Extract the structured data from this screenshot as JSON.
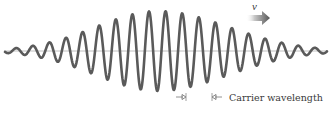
{
  "figure": {
    "colors": {
      "wave": "#5a5a5a",
      "axis": "#b0b0b0",
      "arrow_dark": "#555555",
      "arrow_light": "#d8d8d8",
      "text": "#3a3a3a",
      "background": "#ffffff"
    },
    "axis": {
      "y": 51,
      "x_start": 4,
      "x_end": 327
    },
    "wave": {
      "baseline_y": 51,
      "x_start": 5,
      "x_end": 327,
      "wavelength_px": 16.6,
      "center_x": 158,
      "max_amplitude_px": 40,
      "envelope_sigma_left": 62,
      "envelope_sigma_right": 70,
      "phase_peak_x": 149,
      "stroke_width": 2.6
    },
    "velocity_arrow": {
      "label": "v",
      "x_start": 246,
      "x_end": 270,
      "y": 18,
      "label_x": 252,
      "label_y": 10
    },
    "carrier_wavelength": {
      "label": "Carrier wavelength",
      "left_marker_x": 186,
      "right_marker_x": 212,
      "y": 97,
      "label_x": 229,
      "label_y": 101
    }
  }
}
